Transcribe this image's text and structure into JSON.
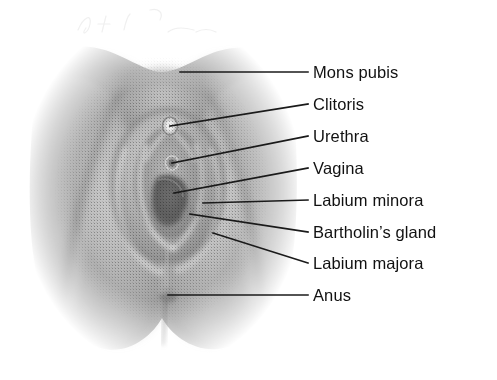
{
  "diagram": {
    "view": "anterior-inferior perineal view",
    "style": {
      "background_color": "#ffffff",
      "text_color": "#111111",
      "leader_line_color": "#1a1a1a",
      "skin_light": "#d7d7d7",
      "skin_mid": "#a0a0a0",
      "skin_shadow": "#7d7d7d",
      "skin_dark": "#636363",
      "highlight": "#e8e8e8"
    },
    "labels": [
      {
        "id": "mons-pubis",
        "text": "Mons pubis",
        "text_x": 313,
        "text_y": 72,
        "leader": {
          "x1": 180,
          "y1": 72,
          "x2": 308,
          "y2": 72
        }
      },
      {
        "id": "clitoris",
        "text": "Clitoris",
        "text_x": 313,
        "text_y": 104,
        "leader": {
          "x1": 170,
          "y1": 126,
          "x2": 308,
          "y2": 104
        }
      },
      {
        "id": "urethra",
        "text": "Urethra",
        "text_x": 313,
        "text_y": 136,
        "leader": {
          "x1": 172,
          "y1": 163,
          "x2": 308,
          "y2": 136
        }
      },
      {
        "id": "vagina",
        "text": "Vagina",
        "text_x": 313,
        "text_y": 168,
        "leader": {
          "x1": 174,
          "y1": 193,
          "x2": 308,
          "y2": 168
        }
      },
      {
        "id": "labium-minora",
        "text": "Labium minora",
        "text_x": 313,
        "text_y": 200,
        "leader": {
          "x1": 203,
          "y1": 203,
          "x2": 308,
          "y2": 200
        }
      },
      {
        "id": "bartholins-gland",
        "text": "Bartholin’s gland",
        "text_x": 313,
        "text_y": 232,
        "leader": {
          "x1": 190,
          "y1": 214,
          "x2": 308,
          "y2": 232
        }
      },
      {
        "id": "labium-majora",
        "text": "Labium majora",
        "text_x": 313,
        "text_y": 263,
        "leader": {
          "x1": 213,
          "y1": 233,
          "x2": 308,
          "y2": 263
        }
      },
      {
        "id": "anus",
        "text": "Anus",
        "text_x": 313,
        "text_y": 295,
        "leader": {
          "x1": 168,
          "y1": 295,
          "x2": 308,
          "y2": 295
        }
      }
    ]
  }
}
